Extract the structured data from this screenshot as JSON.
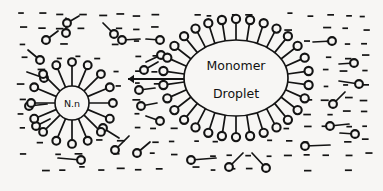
{
  "figure": {
    "domain": "Diagram",
    "title_visible": false,
    "background_color": "#f7f6f4",
    "ink_color": "#141414",
    "width": 383,
    "height": 191
  },
  "labels": {
    "droplet_line1": "Monomer",
    "droplet_line2": "Droplet",
    "micelle": "N.n"
  },
  "droplet": {
    "name": "monomer-droplet",
    "cx": 236,
    "cy": 78,
    "rx": 52,
    "ry": 38,
    "surfactant_count": 30,
    "tail_length": 17,
    "head_radius": 4.1
  },
  "micelle": {
    "name": "micelle-n-n",
    "cx": 72,
    "cy": 103,
    "r": 17,
    "surfactant_count": 16,
    "tail_length": 20,
    "head_radius": 3.9
  },
  "arrow": {
    "name": "diffusion-arrow",
    "x1": 184,
    "y1": 79,
    "x2": 128,
    "y2": 79,
    "direction": "left",
    "head_size": 6
  },
  "free_surfactants": [
    {
      "hx": 40,
      "hy": 60,
      "tx": 28,
      "ty": 50
    },
    {
      "hx": 44,
      "hy": 78,
      "tx": 27,
      "ty": 72
    },
    {
      "hx": 29,
      "hy": 106,
      "tx": 47,
      "ty": 104
    },
    {
      "hx": 36,
      "hy": 126,
      "tx": 50,
      "ty": 119
    },
    {
      "hx": 46,
      "hy": 40,
      "tx": 58,
      "ty": 31
    },
    {
      "hx": 66,
      "hy": 33,
      "tx": 66,
      "ty": 18
    },
    {
      "hx": 67,
      "hy": 23,
      "tx": 79,
      "ty": 16
    },
    {
      "hx": 114,
      "hy": 34,
      "tx": 103,
      "ty": 23
    },
    {
      "hx": 122,
      "hy": 40,
      "tx": 140,
      "ty": 39
    },
    {
      "hx": 160,
      "hy": 40,
      "tx": 146,
      "ty": 39
    },
    {
      "hx": 161,
      "hy": 55,
      "tx": 146,
      "ty": 62
    },
    {
      "hx": 144,
      "hy": 70,
      "tx": 158,
      "ty": 62
    },
    {
      "hx": 139,
      "hy": 90,
      "tx": 155,
      "ty": 88
    },
    {
      "hx": 141,
      "hy": 106,
      "tx": 157,
      "ty": 103
    },
    {
      "hx": 160,
      "hy": 121,
      "tx": 146,
      "ty": 116
    },
    {
      "hx": 115,
      "hy": 150,
      "tx": 129,
      "ty": 136
    },
    {
      "hx": 137,
      "hy": 153,
      "tx": 150,
      "ty": 142
    },
    {
      "hx": 81,
      "hy": 160,
      "tx": 58,
      "ty": 158
    },
    {
      "hx": 191,
      "hy": 160,
      "tx": 216,
      "ty": 158
    },
    {
      "hx": 229,
      "hy": 167,
      "tx": 243,
      "ty": 153
    },
    {
      "hx": 266,
      "hy": 168,
      "tx": 252,
      "ty": 153
    },
    {
      "hx": 305,
      "hy": 146,
      "tx": 330,
      "ty": 145
    },
    {
      "hx": 332,
      "hy": 41,
      "tx": 313,
      "ty": 42
    },
    {
      "hx": 354,
      "hy": 63,
      "tx": 339,
      "ty": 64
    },
    {
      "hx": 359,
      "hy": 84,
      "tx": 339,
      "ty": 81
    },
    {
      "hx": 333,
      "hy": 104,
      "tx": 345,
      "ty": 92
    },
    {
      "hx": 330,
      "hy": 126,
      "tx": 349,
      "ty": 124
    },
    {
      "hx": 355,
      "hy": 134,
      "tx": 340,
      "ty": 133
    },
    {
      "hx": 103,
      "hy": 128,
      "tx": 119,
      "ty": 138
    }
  ],
  "water_dashes": {
    "description": "aqueous-phase dash field",
    "dash_width": 6,
    "dash_height": 1.7,
    "columns": 19,
    "rows": 12,
    "x_start": 20,
    "y_start": 14,
    "x_step": 19,
    "y_step": 14
  }
}
